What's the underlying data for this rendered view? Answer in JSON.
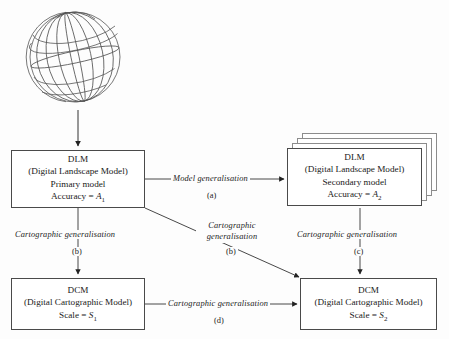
{
  "diagram": {
    "globe": {
      "name": "globe-wireframe",
      "meridians": 8,
      "parallels": 5
    },
    "nodes": {
      "dlm_primary": {
        "id": "DLM",
        "line1": "DLM",
        "line2": "(Digital Landscape Model)",
        "line3": "Primary model",
        "line4_prefix": "Accuracy = ",
        "line4_var": "A",
        "line4_sub": "1"
      },
      "dlm_secondary": {
        "id": "DLM",
        "line1": "DLM",
        "line2": "(Digital Landscape Model)",
        "line3": "Secondary model",
        "line4_prefix": "Accuracy = ",
        "line4_var": "A",
        "line4_sub": "2",
        "stack_count": 4
      },
      "dcm_primary": {
        "id": "DCM",
        "line1": "DCM",
        "line2": "(Digital Cartographic Model)",
        "line3_prefix": "Scale = ",
        "line3_var": "S",
        "line3_sub": "1"
      },
      "dcm_secondary": {
        "id": "DCM",
        "line1": "DCM",
        "line2": "(Digital Cartographic Model)",
        "line3_prefix": "Scale = ",
        "line3_var": "S",
        "line3_sub": "2"
      }
    },
    "edges": {
      "globe_to_dlm": {
        "label": "",
        "tag": ""
      },
      "a": {
        "label": "Model generalisation",
        "tag": "(a)"
      },
      "b_left": {
        "label": "Cartographic  generalisation",
        "tag": "(b)"
      },
      "b_diag": {
        "label_line1": "Cartographic",
        "label_line2": "generalisation",
        "tag": "(b)"
      },
      "c": {
        "label": "Cartographic  generalisation",
        "tag": "(c)"
      },
      "d": {
        "label": "Cartographic  generalisation",
        "tag": "(d)"
      }
    },
    "colors": {
      "background": "#fdfdfd",
      "stroke": "#4a4a4a",
      "ghost_stroke": "#8c8c8c",
      "text": "#1a1a1a"
    }
  }
}
